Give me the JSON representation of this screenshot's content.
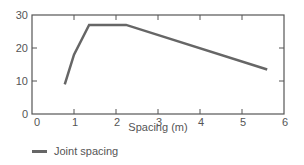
{
  "chart_data": {
    "type": "line",
    "title": "",
    "xlabel": "Spacing (m)",
    "ylabel": "",
    "xlim": [
      0,
      6
    ],
    "ylim": [
      0,
      30
    ],
    "xticks": [
      0,
      1,
      2,
      3,
      4,
      5,
      6
    ],
    "yticks": [
      0,
      10,
      20,
      30
    ],
    "grid": false,
    "legend_position": "bottom-left",
    "series": [
      {
        "name": "Joint spacing",
        "color": "#666666",
        "x": [
          0.78,
          1.0,
          1.36,
          2.24,
          5.6
        ],
        "y": [
          9,
          18,
          27,
          27,
          13.5
        ]
      }
    ]
  },
  "legend": {
    "items": [
      {
        "label": "Joint spacing",
        "color": "#666666"
      }
    ]
  },
  "colors": {
    "axis": "#555555",
    "line": "#666666"
  }
}
